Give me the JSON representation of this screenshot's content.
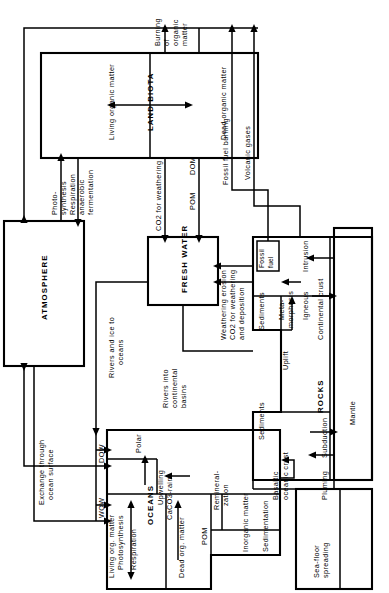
{
  "diagram": {
    "orientation": "rotated-90-ccw",
    "reservoirs": {
      "atmosphere": "ATMOSPHERE",
      "land_biota": "LAND BIOTA",
      "land_biota_living": "Living organic matter",
      "land_biota_dead": "Dead organic matter",
      "fresh_water": "FRESH WATER",
      "oceans": "OCEANS",
      "oceans_living": "Living org. matter",
      "oceans_dead": "Dead org. matter",
      "oceans_inorganic": "Inorganic matter",
      "rocks": "ROCKS",
      "rocks_sediments_1": "Sediments",
      "rocks_sediments_2": "Sediments",
      "rocks_continental_crust": "Continental crust",
      "rocks_basaltic": "Basaltic",
      "rocks_oceanic_crust": "oceanic crust",
      "fossil_fuel_line1": "Fossil",
      "fossil_fuel_line2": "fuel",
      "mantle": "Mantle"
    },
    "flux_labels": {
      "burning_l1": "Burning",
      "burning_l2": "of",
      "burning_l3": "organic",
      "burning_l4": "matter",
      "photosynthesis_l1": "Photo-",
      "photosynthesis_l2": "synthesis",
      "respiration_l1": "Respiration",
      "respiration_l2": "anaerobic",
      "respiration_l3": "fermentation",
      "co2_for_weathering": "CO2 for weathering",
      "pom_land": "POM",
      "dom_land": "DOM",
      "fossil_fuel_burning": "Fossil fuel burning",
      "volcanic_gases": "Volcanic gases",
      "weathering_erosion": "Weathering erosion",
      "co2_weathering_dep_l1": "CO2 for weathering",
      "co2_weathering_dep_l2": "and  deposition",
      "rivers_ice_oceans_l1": "Rivers and ice to",
      "rivers_ice_oceans_l2": "oceans",
      "rivers_into_l1": "Rivers into",
      "rivers_into_l2": "continental",
      "rivers_into_l3": "basins",
      "exchange_l1": "Exchange through",
      "exchange_l2": "ocean surface",
      "dow": "DOW",
      "wow": "WOW",
      "polar": "Polar",
      "upwelling": "Upwelling",
      "caco3_rain": "CaCO3-rain",
      "photosynthesis_ocean": "Photosynthesis",
      "respiration_ocean": "Respiration",
      "pom_ocean": "POM",
      "remineralization_l1": "Remineral-",
      "remineralization_l2": "zation",
      "sedimentation": "Sedimentation",
      "metamorphosis_l1": "Meta-",
      "metamorphosis_l2": "morphosis",
      "igneous": "Igneous",
      "intrusion": "Intrusion",
      "uplift": "Uplift",
      "subduction": "Subduction",
      "pluming": "Pluming",
      "seafloor_l1": "Sea-floor",
      "seafloor_l2": "spreading"
    },
    "colors": {
      "stroke": "#000000",
      "background": "#ffffff"
    }
  }
}
